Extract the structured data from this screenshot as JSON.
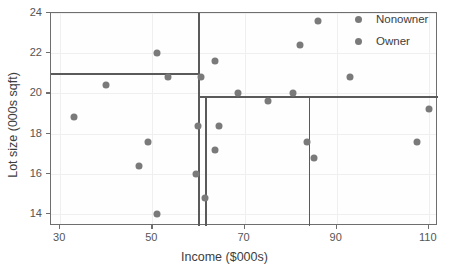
{
  "chart_data": {
    "type": "scatter",
    "title": "",
    "xlabel": "Income ($000s)",
    "ylabel": "Lot size (000s sqft)",
    "xlim": [
      28,
      112
    ],
    "ylim": [
      13.4,
      24.0
    ],
    "xticks": [
      30,
      50,
      70,
      90,
      110
    ],
    "yticks": [
      14,
      16,
      18,
      20,
      22,
      24
    ],
    "grid": true,
    "legend_position": "top-right",
    "point_color": "#7a7a7a",
    "split_color": "#5a5a5a",
    "series": [
      {
        "name": "Nonowner",
        "values": [
          [
            33.0,
            18.8
          ],
          [
            40.0,
            20.4
          ],
          [
            47.0,
            16.4
          ],
          [
            49.0,
            17.6
          ],
          [
            51.0,
            14.0
          ],
          [
            59.5,
            16.0
          ],
          [
            60.0,
            18.4
          ],
          [
            61.5,
            14.8
          ],
          [
            63.5,
            17.2
          ],
          [
            64.5,
            18.4
          ],
          [
            83.5,
            17.6
          ],
          [
            85.0,
            16.8
          ],
          [
            107.5,
            17.6
          ]
        ]
      },
      {
        "name": "Owner",
        "values": [
          [
            51.0,
            22.0
          ],
          [
            53.5,
            20.8
          ],
          [
            60.5,
            20.8
          ],
          [
            63.5,
            21.6
          ],
          [
            68.5,
            20.0
          ],
          [
            75.0,
            19.6
          ],
          [
            80.5,
            20.0
          ],
          [
            82.0,
            22.4
          ],
          [
            86.0,
            23.6
          ],
          [
            93.0,
            20.8
          ],
          [
            110.0,
            19.2
          ]
        ]
      }
    ],
    "split_lines": {
      "vertical": [
        {
          "x": 60.0,
          "y_from": 13.4,
          "y_to": 24.0
        },
        {
          "x": 61.5,
          "y_from": 13.4,
          "y_to": 19.85
        },
        {
          "x": 84.0,
          "y_from": 13.4,
          "y_to": 19.85
        }
      ],
      "horizontal": [
        {
          "y": 21.0,
          "x_from": 28.0,
          "x_to": 60.0
        },
        {
          "y": 19.85,
          "x_from": 60.0,
          "x_to": 112.0
        }
      ]
    }
  },
  "legend": {
    "items": [
      {
        "label": "Nonowner",
        "color": "#7a7a7a"
      },
      {
        "label": "Owner",
        "color": "#7a7a7a"
      }
    ]
  }
}
